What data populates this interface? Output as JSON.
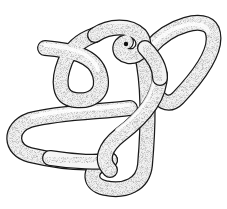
{
  "image": {
    "subject": "stippled-knot-illustration",
    "description": "Pen-and-ink stipple drawing of a thick tube tied into a complex knot",
    "colors": {
      "background": "#ffffff",
      "ink": "#1a1a1a",
      "shade": "#8a8a8a",
      "tube": "#f4f4f4"
    },
    "tube_width": 14
  }
}
